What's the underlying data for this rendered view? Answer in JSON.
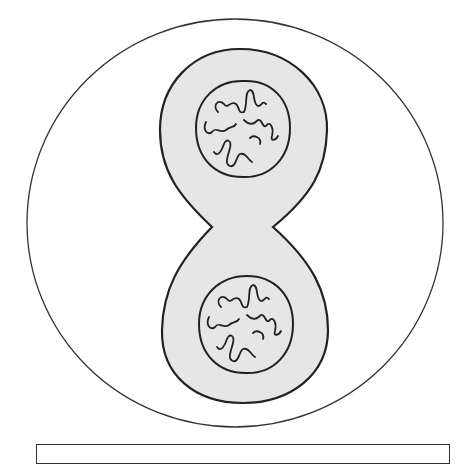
{
  "diagram": {
    "type": "cell-division-telophase",
    "colors": {
      "background": "#ffffff",
      "outline": "#222222",
      "cytoplasm": "#e6e6e6",
      "nucleus_fill": "#e6e6e6"
    },
    "outer_circle": {
      "cx": 235,
      "cy": 223,
      "rx": 208,
      "ry": 204
    },
    "cell": {
      "top_y": 49,
      "bottom_y": 403,
      "pinch_y": 227,
      "pinch_left_x": 212,
      "pinch_right_x": 273
    },
    "nuclei": [
      {
        "name": "upper-daughter-nucleus",
        "cx": 243,
        "cy": 130,
        "r": 47
      },
      {
        "name": "lower-daughter-nucleus",
        "cx": 246,
        "cy": 325,
        "r": 47
      }
    ]
  },
  "label_box": {
    "text": ""
  }
}
